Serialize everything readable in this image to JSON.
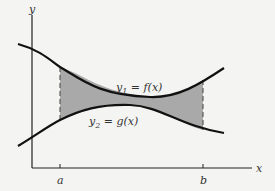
{
  "figure": {
    "type": "area-between-curves",
    "colors": {
      "background": "#f4f4f2",
      "curve": "#111111",
      "shade": "#a9a9a9",
      "axis": "#222222",
      "text": "#333333"
    },
    "axes": {
      "x_label": "x",
      "y_label": "y"
    },
    "bounds": {
      "left_label": "a",
      "right_label": "b"
    },
    "curves": {
      "upper": {
        "lhs": "y",
        "subscript": "1",
        "rhs": " = f(x)"
      },
      "lower": {
        "lhs": "y",
        "subscript": "2",
        "rhs": " = g(x)"
      }
    }
  }
}
